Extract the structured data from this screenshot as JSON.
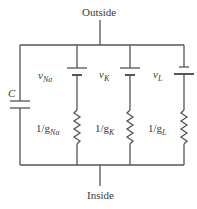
{
  "diagram": {
    "outside_label": "Outside",
    "inside_label": "Inside",
    "capacitor": {
      "label": "C"
    },
    "branches": [
      {
        "id": "na",
        "voltage_symbol": "v",
        "voltage_sub": "Na",
        "conductance_prefix": "1/g",
        "conductance_sub": "Na"
      },
      {
        "id": "k",
        "voltage_symbol": "v",
        "voltage_sub": "K",
        "conductance_prefix": "1/g",
        "conductance_sub": "K"
      },
      {
        "id": "l",
        "voltage_symbol": "v",
        "voltage_sub": "L",
        "conductance_prefix": "1/g",
        "conductance_sub": "L"
      }
    ],
    "colors": {
      "line": "#555555",
      "text": "#3a3a3a",
      "background": "#ffffff"
    }
  }
}
